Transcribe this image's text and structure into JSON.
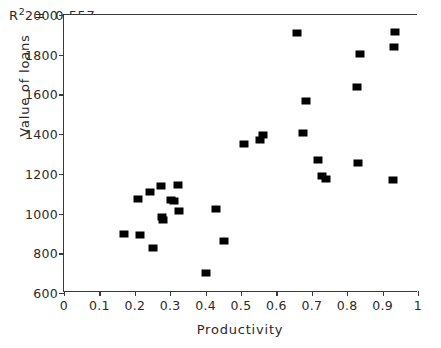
{
  "chart_data": {
    "type": "scatter",
    "title": "",
    "xlabel": "Productivity",
    "ylabel": "Value of loans",
    "xlim": [
      0,
      1
    ],
    "ylim": [
      600,
      2000
    ],
    "grid": false,
    "legend": null,
    "marker": {
      "shape": "square",
      "color": "#000000",
      "size": 9
    },
    "annotations": [
      {
        "name": "r-squared",
        "text": "R²  =  0.557",
        "base": "R",
        "superscript": "2",
        "equals": "=",
        "value": "0.557",
        "x": 0.035,
        "y": 1955
      }
    ],
    "xticks": [
      {
        "value": 0,
        "label": "0"
      },
      {
        "value": 0.1,
        "label": "0.1"
      },
      {
        "value": 0.2,
        "label": "0.2"
      },
      {
        "value": 0.3,
        "label": "0.3"
      },
      {
        "value": 0.4,
        "label": "0.4"
      },
      {
        "value": 0.5,
        "label": "0.5"
      },
      {
        "value": 0.6,
        "label": "0.6"
      },
      {
        "value": 0.7,
        "label": "0.7"
      },
      {
        "value": 0.8,
        "label": "0.8"
      },
      {
        "value": 0.9,
        "label": "0.9"
      },
      {
        "value": 1.0,
        "label": "1"
      }
    ],
    "yticks": [
      {
        "value": 600,
        "label": "600"
      },
      {
        "value": 800,
        "label": "800"
      },
      {
        "value": 1000,
        "label": "1000"
      },
      {
        "value": 1200,
        "label": "1200"
      },
      {
        "value": 1400,
        "label": "1400"
      },
      {
        "value": 1600,
        "label": "1600"
      },
      {
        "value": 1800,
        "label": "1800"
      },
      {
        "value": 2000,
        "label": "2000"
      }
    ],
    "points": [
      {
        "x": 0.17,
        "y": 895
      },
      {
        "x": 0.208,
        "y": 1075
      },
      {
        "x": 0.215,
        "y": 893
      },
      {
        "x": 0.243,
        "y": 1110
      },
      {
        "x": 0.25,
        "y": 827
      },
      {
        "x": 0.275,
        "y": 1138
      },
      {
        "x": 0.276,
        "y": 983
      },
      {
        "x": 0.281,
        "y": 968
      },
      {
        "x": 0.302,
        "y": 1070
      },
      {
        "x": 0.31,
        "y": 1063
      },
      {
        "x": 0.323,
        "y": 1145
      },
      {
        "x": 0.325,
        "y": 1013
      },
      {
        "x": 0.4,
        "y": 700
      },
      {
        "x": 0.428,
        "y": 1025
      },
      {
        "x": 0.452,
        "y": 862
      },
      {
        "x": 0.508,
        "y": 1350
      },
      {
        "x": 0.553,
        "y": 1372
      },
      {
        "x": 0.563,
        "y": 1397
      },
      {
        "x": 0.658,
        "y": 1907
      },
      {
        "x": 0.675,
        "y": 1405
      },
      {
        "x": 0.683,
        "y": 1565
      },
      {
        "x": 0.718,
        "y": 1272
      },
      {
        "x": 0.728,
        "y": 1190
      },
      {
        "x": 0.74,
        "y": 1172
      },
      {
        "x": 0.828,
        "y": 1635
      },
      {
        "x": 0.83,
        "y": 1255
      },
      {
        "x": 0.835,
        "y": 1803
      },
      {
        "x": 0.928,
        "y": 1170
      },
      {
        "x": 0.933,
        "y": 1838
      },
      {
        "x": 0.935,
        "y": 1913
      }
    ]
  }
}
